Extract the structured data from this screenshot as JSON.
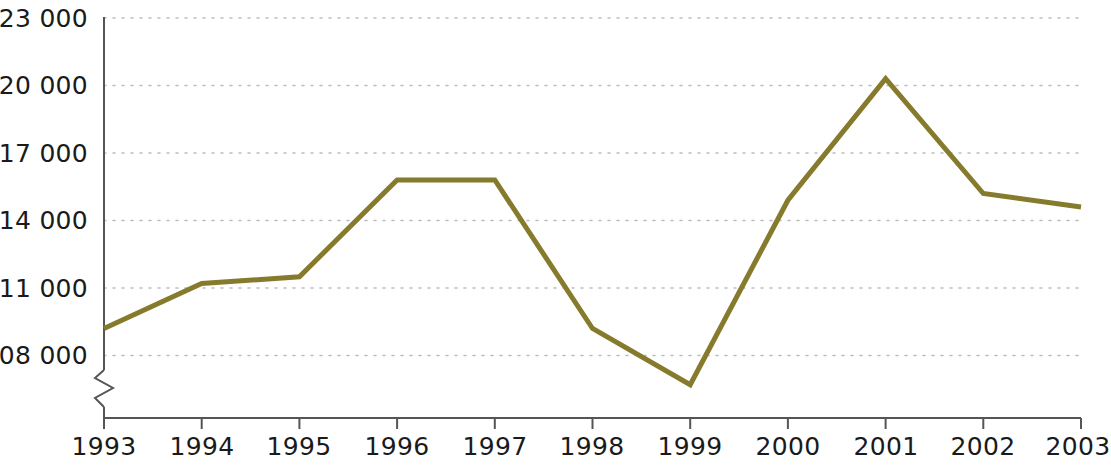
{
  "chart_data": {
    "type": "line",
    "title": "",
    "subtitle": "",
    "xlabel": "",
    "ylabel": "",
    "x": [
      1993,
      1994,
      1995,
      1996,
      1997,
      1998,
      1999,
      2000,
      2001,
      2002,
      2003
    ],
    "categories": [
      "1993",
      "1994",
      "1995",
      "1996",
      "1997",
      "1998",
      "1999",
      "2000",
      "2001",
      "2002",
      "2003"
    ],
    "values": [
      109200,
      111200,
      111500,
      115800,
      115800,
      109200,
      106700,
      114900,
      120300,
      115200,
      114600
    ],
    "series": [
      {
        "name": "",
        "values": [
          109200,
          111200,
          111500,
          115800,
          115800,
          109200,
          106700,
          114900,
          120300,
          115200,
          114600
        ]
      }
    ],
    "ylim": [
      106000,
      123000
    ],
    "xlim": [
      1993,
      2003
    ],
    "yticks": [
      108000,
      111000,
      114000,
      117000,
      120000,
      123000
    ],
    "ytick_labels": [
      "108 000",
      "111 000",
      "114 000",
      "117 000",
      "120 000",
      "123 000"
    ],
    "xtick_labels": [
      "1993",
      "1994",
      "1995",
      "1996",
      "1997",
      "1998",
      "1999",
      "2000",
      "2001",
      "2002",
      "2003"
    ],
    "grid": true,
    "grid_axis": "y",
    "grid_style": "dotted",
    "legend": null,
    "legend_position": "none",
    "axis_break": true,
    "axis_break_note": "y-axis broken below 108 000",
    "annotations": [],
    "colors": {
      "line": "#867B2C",
      "grid": "#b8b8b8",
      "axis": "#555555",
      "text": "#1a1a1a",
      "background": "#ffffff"
    },
    "line_width": 5
  },
  "axis": {
    "y_tick_labels": [
      "123 000",
      "120 000",
      "117 000",
      "114 000",
      "111 000",
      "108 000"
    ],
    "x_tick_labels": [
      "1993",
      "1994",
      "1995",
      "1996",
      "1997",
      "1998",
      "1999",
      "2000",
      "2001",
      "2002",
      "2003"
    ]
  }
}
